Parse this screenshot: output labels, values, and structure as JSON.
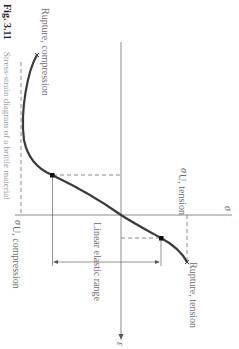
{
  "figure": {
    "caption_number": "Fig. 3.11",
    "caption_text": "Stress-strain diagram of a brittle material",
    "rotation_deg": 90
  },
  "axes": {
    "stress_label": "σ",
    "strain_label": "ε"
  },
  "annotations": {
    "rupture_compression": "Rupture, compression",
    "rupture_tension": "Rupture, tension",
    "sigma_u_compression_symbol": "σ",
    "sigma_u_compression_subscript": "U, compression",
    "sigma_u_tension_symbol": "σ",
    "sigma_u_tension_subscript": "U, tension",
    "linear_elastic_range": "Linear elastic range"
  },
  "colors": {
    "curve": "#3a3a3a",
    "axis": "#8a8a8a",
    "dashed": "#8a8a8a",
    "text": "#6a6a6a"
  }
}
